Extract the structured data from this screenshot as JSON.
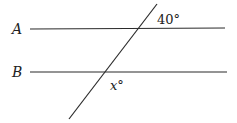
{
  "diagram": {
    "type": "parallel-lines-transversal",
    "background": "#ffffff",
    "stroke_color": "#2a2a2a",
    "lines": [
      {
        "id": "A",
        "label": "A",
        "x1": 30,
        "y1": 29,
        "x2": 225,
        "y2": 28,
        "label_x": 12,
        "label_y": 34
      },
      {
        "id": "B",
        "label": "B",
        "x1": 30,
        "y1": 72,
        "x2": 227,
        "y2": 72,
        "label_x": 12,
        "label_y": 77
      }
    ],
    "transversal": {
      "x1": 157,
      "y1": 4,
      "x2": 69,
      "y2": 119
    },
    "angles": [
      {
        "id": "given",
        "text": "40°",
        "x": 157,
        "y": 24
      },
      {
        "id": "unknown",
        "text": "x°",
        "x": 110,
        "y": 90
      }
    ]
  }
}
